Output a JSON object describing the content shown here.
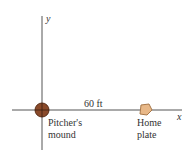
{
  "axes": {
    "x_label": "x",
    "y_label": "y",
    "color": "#555555"
  },
  "distance_label": "60 ft",
  "pitchers_mound": {
    "label_line1": "Pitcher's",
    "label_line2": "mound",
    "fill": "#8a4a2a",
    "stroke": "#5a2e18"
  },
  "home_plate": {
    "label_line1": "Home",
    "label_line2": "plate",
    "fill": "#e8b888",
    "stroke": "#a8784a"
  }
}
